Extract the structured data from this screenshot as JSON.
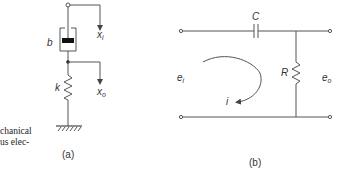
{
  "caption_fragment": [
    "chanical",
    "us elec-"
  ],
  "figure_a": {
    "caption": "(a)",
    "labels": {
      "damper": "b",
      "spring": "k",
      "input_disp": "x",
      "input_sub": "i",
      "output_disp": "x",
      "output_sub": "o"
    }
  },
  "figure_b": {
    "caption": "(b)",
    "labels": {
      "capacitor": "C",
      "resistor": "R",
      "input_voltage": "e",
      "input_sub": "i",
      "output_voltage": "e",
      "output_sub": "o",
      "current": "i"
    }
  }
}
